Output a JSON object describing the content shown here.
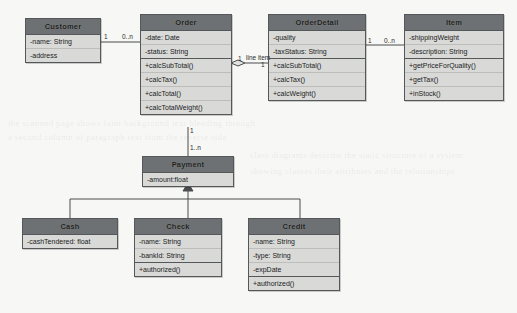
{
  "diagram": {
    "kind": "uml-class-diagram",
    "background": "#f7f7f5",
    "header_color": "#6e7173",
    "row_color": "#d9d9d7",
    "border_color": "#55585a"
  },
  "classes": {
    "customer": {
      "name": "Customer",
      "attributes": [
        "-name: String",
        "-address"
      ],
      "operations": []
    },
    "order": {
      "name": "Order",
      "attributes": [
        "-date: Date",
        "-status: String"
      ],
      "operations": [
        "+calcSubTotal()",
        "+calcTax()",
        "+calcTotal()",
        "+calcTotalWeight()"
      ]
    },
    "orderdetail": {
      "name": "OrderDetail",
      "attributes": [
        "-quality",
        "-taxStatus: String"
      ],
      "operations": [
        "+calcSubTotal()",
        "+calcTax()",
        "+calcWeight()"
      ]
    },
    "item": {
      "name": "Item",
      "attributes": [
        "-shippingWeight",
        "-description: String"
      ],
      "operations": [
        "+getPriceForQuality()",
        "+getTax()",
        "+inStock()"
      ]
    },
    "payment": {
      "name": "Payment",
      "attributes": [
        "-amount:float"
      ],
      "operations": []
    },
    "cash": {
      "name": "Cash",
      "attributes": [
        "-cashTendered: float"
      ],
      "operations": []
    },
    "check": {
      "name": "Check",
      "attributes": [
        "-name: String",
        "-bankId: String"
      ],
      "operations": [
        "+authorized()"
      ]
    },
    "credit": {
      "name": "Credit",
      "attributes": [
        "-name: String",
        "-type: String",
        "-expDate"
      ],
      "operations": [
        "+authorized()"
      ]
    }
  },
  "multiplicities": {
    "customer_order_left": "1",
    "customer_order_right": "0..n",
    "order_detail_left": "1",
    "order_detail_right": "1",
    "detail_item_left": "1",
    "detail_item_right": "0..n",
    "order_payment_top": "1",
    "order_payment_bottom": "1..n"
  },
  "edge_labels": {
    "line_item": "line item"
  },
  "ghost_text": [
    "the scanned page shows faint background text bleeding through",
    "a second column of paragraph text from the reverse side",
    "class diagrams describe the static structure of a system",
    "showing classes their attributes and the relationships"
  ]
}
